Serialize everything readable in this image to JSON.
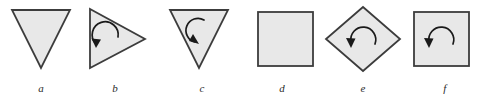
{
  "figure": {
    "name": "symmetry-figures-row",
    "background_color": "#ffffff",
    "shape_fill_color": "#e8e8e8",
    "shape_stroke_color": "#3c3c3c",
    "arrow_color": "#1a1a1a",
    "label_color": "#2b2b2b",
    "items": [
      {
        "id": "a",
        "label": "a",
        "shape": "triangle-down",
        "shape_name": "downward-pointing-triangle",
        "has_arrow": false,
        "arrow_direction": ""
      },
      {
        "id": "b",
        "label": "b",
        "shape": "triangle-right",
        "shape_name": "right-pointing-triangle",
        "has_arrow": true,
        "arrow_direction": "counterclockwise"
      },
      {
        "id": "c",
        "label": "c",
        "shape": "triangle-down",
        "shape_name": "downward-pointing-triangle",
        "has_arrow": true,
        "arrow_direction": "clockwise"
      },
      {
        "id": "d",
        "label": "d",
        "shape": "square",
        "shape_name": "square",
        "has_arrow": false,
        "arrow_direction": ""
      },
      {
        "id": "e",
        "label": "e",
        "shape": "diamond",
        "shape_name": "diamond-rotated-square",
        "has_arrow": true,
        "arrow_direction": "counterclockwise"
      },
      {
        "id": "f",
        "label": "f",
        "shape": "square",
        "shape_name": "square",
        "has_arrow": true,
        "arrow_direction": "counterclockwise"
      }
    ]
  }
}
